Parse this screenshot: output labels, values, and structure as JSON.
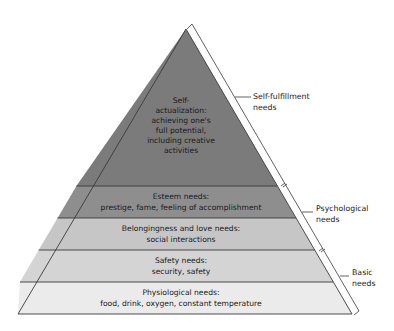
{
  "diagram": {
    "type": "pyramid",
    "title": "",
    "tiers": [
      {
        "id": "self-actualization",
        "lines": [
          "Self-",
          "actualization:",
          "achieving one's",
          "full potential,",
          "including creative",
          "activities"
        ],
        "color": "#7b7b7b"
      },
      {
        "id": "esteem",
        "lines": [
          "Esteem needs:",
          "prestige, fame, feeling of accomplishment"
        ],
        "color": "#8e8e8e"
      },
      {
        "id": "belongingness",
        "lines": [
          "Belongingness and love needs:",
          "social interactions"
        ],
        "color": "#c6c6c6"
      },
      {
        "id": "safety",
        "lines": [
          "Safety needs:",
          "security, safety"
        ],
        "color": "#d4d4d4"
      },
      {
        "id": "physiological",
        "lines": [
          "Physiological needs:",
          "food, drink, oxygen, constant temperature"
        ],
        "color": "#ebebeb"
      }
    ],
    "groups": [
      {
        "id": "self-fulfillment",
        "lines": [
          "Self-fulfillment",
          "needs"
        ],
        "covers": [
          "self-actualization"
        ]
      },
      {
        "id": "psychological",
        "lines": [
          "Psychological",
          "needs"
        ],
        "covers": [
          "esteem",
          "belongingness"
        ]
      },
      {
        "id": "basic",
        "lines": [
          "Basic",
          "needs"
        ],
        "covers": [
          "safety",
          "physiological"
        ]
      }
    ],
    "colors": {
      "outline": "#3a3a3a",
      "text": "#1a1a1a",
      "background": "#ffffff"
    }
  }
}
